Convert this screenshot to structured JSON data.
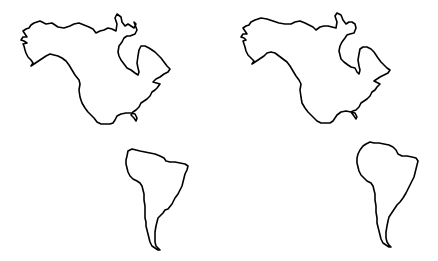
{
  "figure": {
    "panels": [
      {
        "label": "left-map",
        "continents": [
          "north-america-outline",
          "south-america-outline"
        ]
      },
      {
        "label": "right-map",
        "continents": [
          "north-america-outline",
          "south-america-outline"
        ]
      }
    ],
    "colors": {
      "background": "#ffffff",
      "outline": "#000000"
    }
  }
}
